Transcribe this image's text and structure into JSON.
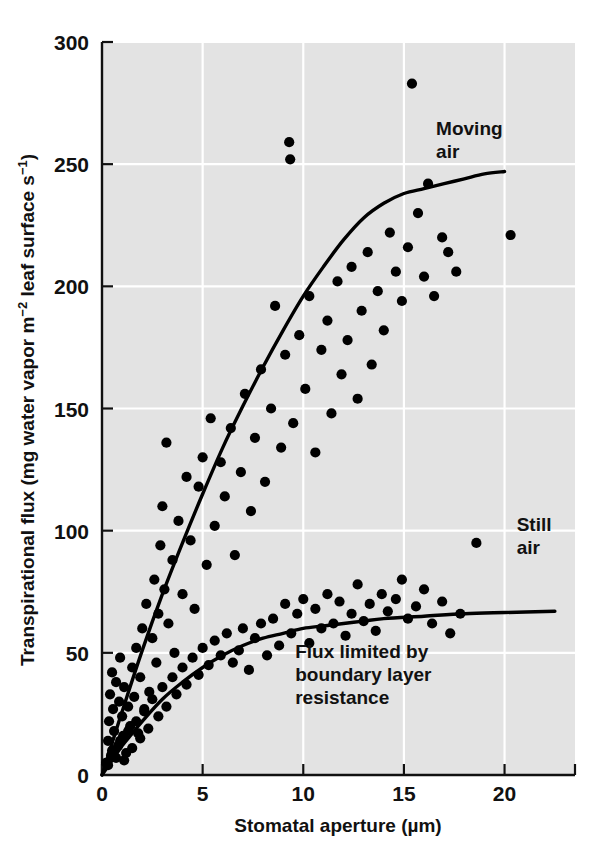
{
  "chart_data": {
    "type": "scatter",
    "title": "",
    "xlabel": "Stomatal aperture (µm)",
    "ylabel_parts": {
      "prefix": "Transpirational flux (mg water vapor m",
      "sup1": "−2",
      "middle": " leaf surface s",
      "sup2": "−1",
      "suffix": ")"
    },
    "ylabel": "Transpirational flux (mg water vapor m−2 leaf surface s−1)",
    "xlim": [
      0,
      23.5
    ],
    "ylim": [
      0,
      300
    ],
    "xticks": [
      0,
      5,
      10,
      15,
      20
    ],
    "xtick_labels": [
      "0",
      "5",
      "10",
      "15",
      "20"
    ],
    "yticks": [
      0,
      50,
      100,
      150,
      200,
      250,
      300
    ],
    "ytick_labels": [
      "0",
      "50",
      "100",
      "150",
      "200",
      "250",
      "300"
    ],
    "grid": true,
    "grid_color": "#ffffff",
    "plot_bg": "#e3e3e3",
    "marker_color": "#000000",
    "curve_color": "#000000",
    "legend_position": "inline-annotations",
    "annotations": [
      {
        "name": "moving-air",
        "text_lines": [
          "Moving",
          "air"
        ],
        "x": 16.6,
        "y": 262
      },
      {
        "name": "still-air",
        "text_lines": [
          "Still",
          "air"
        ],
        "x": 20.6,
        "y": 100
      },
      {
        "name": "boundary-layer-note",
        "text_lines": [
          "Flux limited by",
          "boundary layer",
          "resistance"
        ],
        "x": 9.6,
        "y": 48
      }
    ],
    "series": [
      {
        "name": "Moving air",
        "curve_label": "Moving air",
        "marker": "filled-circle",
        "points": [
          [
            0.2,
            5
          ],
          [
            0.3,
            14
          ],
          [
            0.35,
            22
          ],
          [
            0.4,
            33
          ],
          [
            0.45,
            8
          ],
          [
            0.5,
            42
          ],
          [
            0.55,
            27
          ],
          [
            0.6,
            18
          ],
          [
            0.7,
            38
          ],
          [
            0.8,
            12
          ],
          [
            0.85,
            30
          ],
          [
            0.9,
            48
          ],
          [
            1.0,
            24
          ],
          [
            1.05,
            16
          ],
          [
            1.1,
            36
          ],
          [
            1.2,
            9
          ],
          [
            1.3,
            28
          ],
          [
            1.4,
            20
          ],
          [
            1.5,
            44
          ],
          [
            1.6,
            32
          ],
          [
            1.7,
            52
          ],
          [
            1.8,
            17
          ],
          [
            1.9,
            40
          ],
          [
            2.0,
            60
          ],
          [
            2.1,
            26
          ],
          [
            2.2,
            70
          ],
          [
            2.35,
            34
          ],
          [
            2.5,
            56
          ],
          [
            2.6,
            80
          ],
          [
            2.7,
            46
          ],
          [
            2.8,
            66
          ],
          [
            2.9,
            94
          ],
          [
            3.0,
            110
          ],
          [
            3.1,
            76
          ],
          [
            3.2,
            136
          ],
          [
            3.3,
            62
          ],
          [
            3.5,
            88
          ],
          [
            3.6,
            50
          ],
          [
            3.8,
            104
          ],
          [
            4.0,
            74
          ],
          [
            4.2,
            122
          ],
          [
            4.4,
            96
          ],
          [
            4.6,
            68
          ],
          [
            4.8,
            118
          ],
          [
            5.0,
            130
          ],
          [
            5.2,
            86
          ],
          [
            5.4,
            146
          ],
          [
            5.6,
            102
          ],
          [
            5.9,
            128
          ],
          [
            6.1,
            114
          ],
          [
            6.4,
            142
          ],
          [
            6.6,
            90
          ],
          [
            6.9,
            124
          ],
          [
            7.1,
            156
          ],
          [
            7.4,
            108
          ],
          [
            7.6,
            138
          ],
          [
            7.9,
            166
          ],
          [
            8.1,
            120
          ],
          [
            8.4,
            150
          ],
          [
            8.6,
            192
          ],
          [
            8.9,
            134
          ],
          [
            9.1,
            172
          ],
          [
            9.3,
            259
          ],
          [
            9.35,
            252
          ],
          [
            9.5,
            144
          ],
          [
            9.8,
            180
          ],
          [
            10.1,
            158
          ],
          [
            10.3,
            196
          ],
          [
            10.6,
            132
          ],
          [
            10.9,
            174
          ],
          [
            11.2,
            186
          ],
          [
            11.4,
            148
          ],
          [
            11.7,
            202
          ],
          [
            11.9,
            164
          ],
          [
            12.2,
            178
          ],
          [
            12.4,
            208
          ],
          [
            12.7,
            154
          ],
          [
            12.9,
            190
          ],
          [
            13.2,
            214
          ],
          [
            13.4,
            168
          ],
          [
            13.7,
            198
          ],
          [
            14.0,
            182
          ],
          [
            14.3,
            222
          ],
          [
            14.6,
            206
          ],
          [
            14.9,
            194
          ],
          [
            15.2,
            216
          ],
          [
            15.4,
            283
          ],
          [
            15.7,
            230
          ],
          [
            16.0,
            204
          ],
          [
            16.2,
            242
          ],
          [
            16.5,
            196
          ],
          [
            16.9,
            220
          ],
          [
            17.2,
            214
          ],
          [
            17.6,
            206
          ],
          [
            18.6,
            95
          ],
          [
            20.3,
            221
          ]
        ],
        "fit_curve": {
          "description": "saturating curve rising from origin to ~247 at aperture 20",
          "points": [
            [
              0,
              0
            ],
            [
              0.5,
              13
            ],
            [
              1,
              26
            ],
            [
              2,
              51
            ],
            [
              3,
              74
            ],
            [
              4,
              95
            ],
            [
              5,
              115
            ],
            [
              6,
              134
            ],
            [
              7,
              151
            ],
            [
              8,
              167
            ],
            [
              9,
              182
            ],
            [
              10,
              196
            ],
            [
              11,
              208
            ],
            [
              12,
              219
            ],
            [
              13,
              228
            ],
            [
              14,
              234
            ],
            [
              15,
              238
            ],
            [
              16,
              240
            ],
            [
              17,
              242
            ],
            [
              18,
              244
            ],
            [
              19,
              246
            ],
            [
              20,
              247
            ]
          ]
        }
      },
      {
        "name": "Still air",
        "curve_label": "Still air",
        "marker": "filled-circle",
        "points": [
          [
            0.3,
            4
          ],
          [
            0.5,
            10
          ],
          [
            0.7,
            7
          ],
          [
            0.9,
            14
          ],
          [
            1.1,
            6
          ],
          [
            1.3,
            18
          ],
          [
            1.5,
            11
          ],
          [
            1.7,
            22
          ],
          [
            1.9,
            15
          ],
          [
            2.1,
            27
          ],
          [
            2.3,
            19
          ],
          [
            2.5,
            31
          ],
          [
            2.8,
            24
          ],
          [
            3.0,
            36
          ],
          [
            3.2,
            28
          ],
          [
            3.5,
            40
          ],
          [
            3.7,
            33
          ],
          [
            4.0,
            44
          ],
          [
            4.2,
            37
          ],
          [
            4.5,
            48
          ],
          [
            4.8,
            41
          ],
          [
            5.0,
            52
          ],
          [
            5.3,
            45
          ],
          [
            5.6,
            55
          ],
          [
            5.9,
            49
          ],
          [
            6.2,
            58
          ],
          [
            6.5,
            46
          ],
          [
            6.8,
            51
          ],
          [
            7.0,
            60
          ],
          [
            7.3,
            43
          ],
          [
            7.6,
            56
          ],
          [
            7.9,
            62
          ],
          [
            8.2,
            49
          ],
          [
            8.5,
            64
          ],
          [
            8.8,
            53
          ],
          [
            9.1,
            70
          ],
          [
            9.4,
            58
          ],
          [
            9.7,
            66
          ],
          [
            10.0,
            72
          ],
          [
            10.3,
            54
          ],
          [
            10.6,
            68
          ],
          [
            10.9,
            60
          ],
          [
            11.2,
            74
          ],
          [
            11.5,
            62
          ],
          [
            11.8,
            71
          ],
          [
            12.1,
            57
          ],
          [
            12.4,
            66
          ],
          [
            12.7,
            78
          ],
          [
            13.0,
            63
          ],
          [
            13.3,
            70
          ],
          [
            13.6,
            59
          ],
          [
            13.9,
            74
          ],
          [
            14.2,
            67
          ],
          [
            14.6,
            72
          ],
          [
            14.9,
            80
          ],
          [
            15.2,
            64
          ],
          [
            15.6,
            69
          ],
          [
            16.0,
            76
          ],
          [
            16.4,
            62
          ],
          [
            16.9,
            71
          ],
          [
            17.3,
            58
          ],
          [
            17.8,
            66
          ]
        ],
        "fit_curve": {
          "description": "saturating curve rising from origin, plateau ~67 at aperture 22.5",
          "points": [
            [
              0,
              0
            ],
            [
              0.5,
              6
            ],
            [
              1,
              12
            ],
            [
              1.5,
              17
            ],
            [
              2,
              22
            ],
            [
              3,
              31
            ],
            [
              4,
              38
            ],
            [
              5,
              44
            ],
            [
              6,
              49
            ],
            [
              7,
              53
            ],
            [
              8,
              56
            ],
            [
              9,
              58
            ],
            [
              10,
              60
            ],
            [
              11,
              61
            ],
            [
              12,
              62
            ],
            [
              13,
              63
            ],
            [
              14,
              64
            ],
            [
              16,
              65
            ],
            [
              18,
              66
            ],
            [
              20,
              66.5
            ],
            [
              22.5,
              67
            ]
          ]
        }
      }
    ]
  },
  "figure": {
    "name": "transpiration-vs-stomatal-aperture-scatter"
  }
}
